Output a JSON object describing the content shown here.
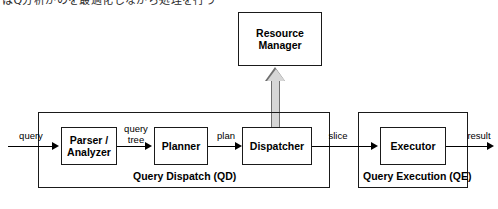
{
  "figure": {
    "top_cropped_text": "はQ分析がのを最適化しながら処理を行う",
    "nodes": [
      {
        "id": "resource-manager",
        "label": "Resource\nManager",
        "line1": "Resource",
        "line2": "Manager"
      },
      {
        "id": "parser-analyzer",
        "label": "Parser /\nAnalyzer",
        "line1": "Parser /",
        "line2": "Analyzer"
      },
      {
        "id": "planner",
        "label": "Planner",
        "line1": "Planner",
        "line2": ""
      },
      {
        "id": "dispatcher",
        "label": "Dispatcher",
        "line1": "Dispatcher",
        "line2": ""
      },
      {
        "id": "executor",
        "label": "Executor",
        "line1": "Executor",
        "line2": ""
      }
    ],
    "groups": [
      {
        "id": "query-dispatch",
        "label": "Query Dispatch (QD)"
      },
      {
        "id": "query-execution",
        "label": "Query Execution (QE)"
      }
    ],
    "edges": [
      {
        "id": "query",
        "label": "query",
        "line1": "query",
        "line2": ""
      },
      {
        "id": "query-tree",
        "label": "query tree",
        "line1": "query",
        "line2": "tree"
      },
      {
        "id": "plan",
        "label": "plan",
        "line1": "plan",
        "line2": ""
      },
      {
        "id": "slice",
        "label": "slice",
        "line1": "slice",
        "line2": ""
      },
      {
        "id": "result",
        "label": "result",
        "line1": "result",
        "line2": ""
      }
    ],
    "colors": {
      "stroke": "#1a1a1a",
      "fill": "#ffffff",
      "thick_arrow_fill": "#d6d6d6",
      "thick_arrow_stroke": "#6e6e6e"
    }
  }
}
